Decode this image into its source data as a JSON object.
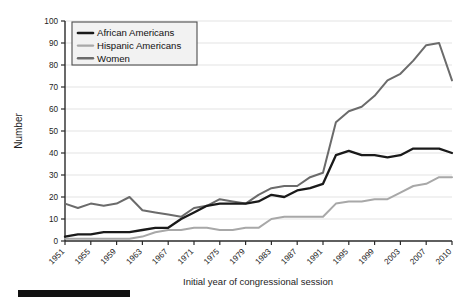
{
  "chart_data": {
    "type": "line",
    "title": "",
    "xlabel": "Initial year of congressional session",
    "ylabel": "Number",
    "ylim": [
      0,
      100
    ],
    "ytick_labels": [
      "0",
      "10",
      "20",
      "30",
      "40",
      "50",
      "60",
      "70",
      "80",
      "90",
      "100"
    ],
    "ytick_values": [
      0,
      10,
      20,
      30,
      40,
      50,
      60,
      70,
      80,
      90,
      100
    ],
    "grid": "horizontal",
    "legend_position": "top-left",
    "categories": [
      "1951",
      "1953",
      "1955",
      "1957",
      "1959",
      "1961",
      "1963",
      "1965",
      "1967",
      "1969",
      "1971",
      "1973",
      "1975",
      "1977",
      "1979",
      "1981",
      "1983",
      "1985",
      "1987",
      "1989",
      "1991",
      "1993",
      "1995",
      "1997",
      "1999",
      "2001",
      "2003",
      "2005",
      "2007",
      "2009",
      "2010"
    ],
    "xtick_labels": [
      "1951",
      "1955",
      "1959",
      "1963",
      "1967",
      "1971",
      "1975",
      "1979",
      "1983",
      "1987",
      "1991",
      "1995",
      "1999",
      "2003",
      "2007",
      "2010"
    ],
    "series": [
      {
        "name": "African Americans",
        "color": "#1a1a1a",
        "width": 2.3,
        "values": [
          2,
          3,
          3,
          4,
          4,
          4,
          5,
          6,
          6,
          10,
          13,
          16,
          17,
          17,
          17,
          18,
          21,
          20,
          23,
          24,
          26,
          39,
          41,
          39,
          39,
          38,
          39,
          42,
          42,
          42,
          40
        ]
      },
      {
        "name": "Hispanic Americans",
        "color": "#a8a8a8",
        "width": 2.0,
        "values": [
          1,
          1,
          1,
          1,
          1,
          1,
          2,
          4,
          5,
          5,
          6,
          6,
          5,
          5,
          6,
          6,
          10,
          11,
          11,
          11,
          11,
          17,
          18,
          18,
          19,
          19,
          22,
          25,
          26,
          29,
          29
        ]
      },
      {
        "name": "Women",
        "color": "#6b6b6b",
        "width": 2.0,
        "values": [
          17,
          15,
          17,
          16,
          17,
          20,
          14,
          13,
          12,
          11,
          15,
          16,
          19,
          18,
          17,
          21,
          24,
          25,
          25,
          29,
          31,
          54,
          59,
          61,
          66,
          73,
          76,
          82,
          89,
          90,
          73
        ]
      }
    ]
  },
  "legend": {
    "items": [
      {
        "label": "African Americans"
      },
      {
        "label": "Hispanic Americans"
      },
      {
        "label": "Women"
      }
    ]
  },
  "colors": {
    "background": "#ffffff",
    "axis": "#2a2a2a",
    "grid": "#dcdcdc",
    "legend_border": "#4d4d4d",
    "legend_bg": "#f2f2f2",
    "caption_bar": "#111111"
  },
  "caption_bar": {
    "present": true
  }
}
